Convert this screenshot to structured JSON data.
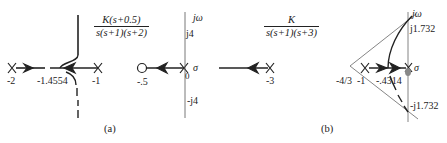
{
  "figure_a": {
    "transfer_function": {
      "numerator": "K(s+0.5)",
      "denominator": "s(s+1)(s+2)"
    },
    "poles": [
      "-2",
      "-1",
      "0"
    ],
    "zeros": [
      "-.5"
    ],
    "breakaway_label": "-1.4554",
    "axis_labels": {
      "imag": "jω",
      "real": "σ",
      "upper_tick": "j4",
      "lower_tick": "-j4",
      "origin": "0"
    },
    "caption": "(a)"
  },
  "figure_b": {
    "transfer_function": {
      "numerator": "K",
      "denominator": "s(s+1)(s+3)"
    },
    "poles": [
      "-3",
      "-1",
      "0"
    ],
    "asymptote_centroid_label": "-4/3",
    "breakaway_label": "-.4314",
    "axis_labels": {
      "imag": "jω",
      "real": "σ",
      "upper_tick": "j1.732",
      "lower_tick": "-j1.732"
    },
    "caption": "(b)"
  }
}
